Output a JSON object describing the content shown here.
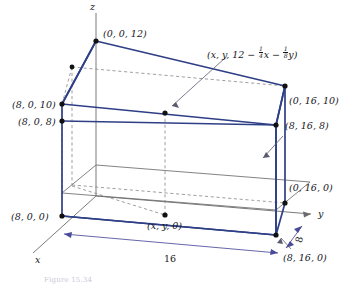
{
  "figure": {
    "kind": "3d-solid-diagram",
    "colors": {
      "edge": "#2e3f86",
      "thin_edge": "#5a5a5a",
      "dashed": "#8a8a8a",
      "vertex": "#111111",
      "text": "#15161c",
      "background": "#ffffff",
      "caption": "#c9c9d6"
    },
    "axes": {
      "z_label": "z",
      "y_label": "y",
      "x_label": "x"
    },
    "dimensions": {
      "length_label": "16",
      "depth_label": "8"
    },
    "caption_text": "Figure 15.34",
    "plane_equation": {
      "prefix": "(x, y, 12 − ",
      "term1_num": "1",
      "term1_den": "4",
      "term1_var": "x",
      "minus": " − ",
      "term2_num": "1",
      "term2_den": "8",
      "term2_var": "y",
      "suffix": ")"
    },
    "vertices": [
      {
        "name": "top-z-intercept",
        "label": "(0, 0, 12)"
      },
      {
        "name": "left-upper-back",
        "label": "(8, 0, 10)"
      },
      {
        "name": "left-upper-front",
        "label": "(8, 0, 8)"
      },
      {
        "name": "right-upper-back",
        "label": "(0, 16, 10)"
      },
      {
        "name": "right-upper-front",
        "label": "(8, 16, 8)"
      },
      {
        "name": "right-lower-back",
        "label": "(0, 16, 0)"
      },
      {
        "name": "right-lower-front",
        "label": "(8, 16, 0)"
      },
      {
        "name": "left-lower-front",
        "label": "(8, 0, 0)"
      },
      {
        "name": "base-sample-point",
        "label": "(x, y, 0)"
      }
    ]
  }
}
